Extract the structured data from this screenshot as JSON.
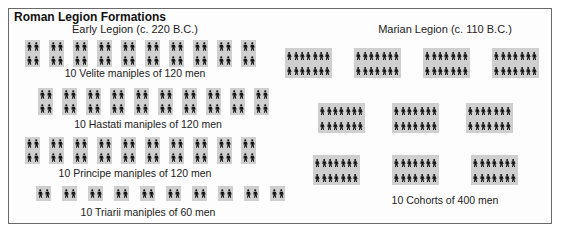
{
  "title": "Roman Legion Formations",
  "colors": {
    "unit_bg": "#cfcfcf",
    "figure": "#111111",
    "border": "#6a6a6a"
  },
  "early_legion": {
    "heading": "Early Legion (c. 220 B.C.)",
    "rows": [
      {
        "name": "velite",
        "caption": "10 Velite maniples of 120 men",
        "units": 10,
        "figure_rows": 2,
        "figures_per_row": 2
      },
      {
        "name": "hastati",
        "caption": "10 Hastati maniples of 120 men",
        "units": 10,
        "figure_rows": 2,
        "figures_per_row": 2
      },
      {
        "name": "principe",
        "caption": "10 Principe maniples of 120 men",
        "units": 10,
        "figure_rows": 2,
        "figures_per_row": 2
      },
      {
        "name": "triarii",
        "caption": "10 Triarii maniples of 60 men",
        "units": 10,
        "figure_rows": 1,
        "figures_per_row": 2
      }
    ]
  },
  "marian_legion": {
    "heading": "Marian Legion (c. 110 B.C.)",
    "caption": "10 Cohorts of 400 men",
    "rows": [
      {
        "units": 4,
        "figure_rows": 2,
        "figures_per_row": 7
      },
      {
        "units": 3,
        "figure_rows": 2,
        "figures_per_row": 7
      },
      {
        "units": 3,
        "figure_rows": 2,
        "figures_per_row": 7
      }
    ]
  },
  "chart_data": {
    "type": "diagram",
    "title": "Roman Legion Formations",
    "groups": [
      {
        "name": "Early Legion (c. 220 B.C.)",
        "formations": [
          {
            "type": "Velite",
            "units": 10,
            "men_per_unit": 120
          },
          {
            "type": "Hastati",
            "units": 10,
            "men_per_unit": 120
          },
          {
            "type": "Principe",
            "units": 10,
            "men_per_unit": 120
          },
          {
            "type": "Triarii",
            "units": 10,
            "men_per_unit": 60
          }
        ]
      },
      {
        "name": "Marian Legion (c. 110 B.C.)",
        "formations": [
          {
            "type": "Cohort",
            "units": 10,
            "men_per_unit": 400
          }
        ]
      }
    ]
  }
}
